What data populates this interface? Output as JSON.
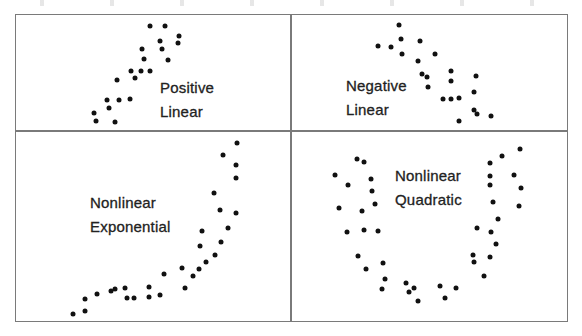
{
  "figure": {
    "panels": [
      {
        "id": "positive-linear",
        "label_lines": [
          "Positive",
          "Linear"
        ],
        "label_pos": {
          "x": 160,
          "y": 76
        },
        "points": [
          [
            150,
            26
          ],
          [
            165,
            26
          ],
          [
            179,
            36
          ],
          [
            178,
            43
          ],
          [
            160,
            41
          ],
          [
            162,
            49
          ],
          [
            142,
            49
          ],
          [
            144,
            59
          ],
          [
            168,
            60
          ],
          [
            131,
            71
          ],
          [
            141,
            71
          ],
          [
            150,
            71
          ],
          [
            117,
            80
          ],
          [
            135,
            78
          ],
          [
            107,
            100
          ],
          [
            119,
            100
          ],
          [
            130,
            99
          ],
          [
            109,
            108
          ],
          [
            94,
            113
          ],
          [
            96,
            121
          ],
          [
            115,
            122
          ]
        ]
      },
      {
        "id": "negative-linear",
        "label_lines": [
          "Negative",
          "Linear"
        ],
        "label_pos": {
          "x": 346,
          "y": 74
        },
        "points": [
          [
            399,
            25
          ],
          [
            401,
            39
          ],
          [
            378,
            46
          ],
          [
            391,
            47
          ],
          [
            420,
            41
          ],
          [
            402,
            54
          ],
          [
            435,
            54
          ],
          [
            418,
            61
          ],
          [
            422,
            74
          ],
          [
            427,
            77
          ],
          [
            428,
            87
          ],
          [
            451,
            71
          ],
          [
            451,
            81
          ],
          [
            476,
            76
          ],
          [
            474,
            92
          ],
          [
            443,
            99
          ],
          [
            451,
            99
          ],
          [
            459,
            98
          ],
          [
            474,
            110
          ],
          [
            477,
            114
          ],
          [
            491,
            116
          ],
          [
            459,
            121
          ]
        ]
      },
      {
        "id": "nonlinear-exponential",
        "label_lines": [
          "Nonlinear",
          "Exponential"
        ],
        "label_pos": {
          "x": 90,
          "y": 191
        },
        "points": [
          [
            73,
            314
          ],
          [
            85,
            311
          ],
          [
            85,
            299
          ],
          [
            97,
            294
          ],
          [
            111,
            291
          ],
          [
            115,
            289
          ],
          [
            125,
            288
          ],
          [
            127,
            298
          ],
          [
            134,
            298
          ],
          [
            149,
            297
          ],
          [
            149,
            287
          ],
          [
            160,
            295
          ],
          [
            164,
            274
          ],
          [
            185,
            288
          ],
          [
            193,
            276
          ],
          [
            182,
            268
          ],
          [
            199,
            269
          ],
          [
            206,
            262
          ],
          [
            215,
            255
          ],
          [
            221,
            242
          ],
          [
            200,
            246
          ],
          [
            202,
            231
          ],
          [
            228,
            228
          ],
          [
            236,
            213
          ],
          [
            220,
            210
          ],
          [
            214,
            193
          ],
          [
            236,
            178
          ],
          [
            236,
            165
          ],
          [
            223,
            155
          ],
          [
            237,
            143
          ]
        ]
      },
      {
        "id": "nonlinear-quadratic",
        "label_lines": [
          "Nonlinear",
          "Quadratic"
        ],
        "label_pos": {
          "x": 395,
          "y": 164
        },
        "points": [
          [
            357,
            159
          ],
          [
            364,
            162
          ],
          [
            335,
            175
          ],
          [
            348,
            185
          ],
          [
            371,
            179
          ],
          [
            372,
            191
          ],
          [
            375,
            204
          ],
          [
            339,
            208
          ],
          [
            362,
            211
          ],
          [
            347,
            232
          ],
          [
            364,
            230
          ],
          [
            378,
            231
          ],
          [
            358,
            256
          ],
          [
            366,
            269
          ],
          [
            383,
            263
          ],
          [
            385,
            279
          ],
          [
            382,
            289
          ],
          [
            406,
            283
          ],
          [
            414,
            288
          ],
          [
            409,
            292
          ],
          [
            418,
            301
          ],
          [
            440,
            286
          ],
          [
            456,
            288
          ],
          [
            445,
            298
          ],
          [
            484,
            276
          ],
          [
            473,
            255
          ],
          [
            474,
            262
          ],
          [
            490,
            257
          ],
          [
            496,
            244
          ],
          [
            491,
            232
          ],
          [
            477,
            228
          ],
          [
            498,
            219
          ],
          [
            519,
            206
          ],
          [
            493,
            202
          ],
          [
            521,
            188
          ],
          [
            490,
            185
          ],
          [
            514,
            175
          ],
          [
            490,
            176
          ],
          [
            490,
            163
          ],
          [
            502,
            156
          ],
          [
            520,
            149
          ]
        ]
      }
    ],
    "colors": {
      "border": "#7a7a7a",
      "dot": "#111111",
      "text": "#222222"
    }
  },
  "labels": {
    "positive_linear": {
      "line1": "Positive",
      "line2": "Linear"
    },
    "negative_linear": {
      "line1": "Negative",
      "line2": "Linear"
    },
    "nonlinear_exponential": {
      "line1": "Nonlinear",
      "line2": "Exponential"
    },
    "nonlinear_quadratic": {
      "line1": "Nonlinear",
      "line2": "Quadratic"
    }
  }
}
